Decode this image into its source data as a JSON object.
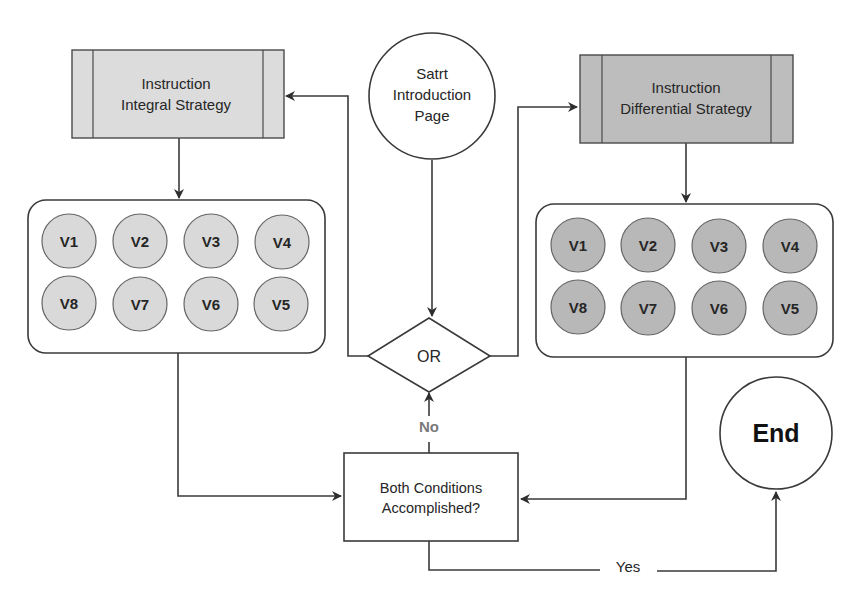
{
  "diagram": {
    "type": "flowchart",
    "colors": {
      "background": "#ffffff",
      "stroke": "#3a3a3a",
      "integral_fill": "#dcdcdc",
      "differential_fill": "#bdbdbd",
      "integral_node_fill": "#d9d9d9",
      "differential_node_fill": "#b8b8b8",
      "no_label_color": "#7a7a7a"
    },
    "start": {
      "lines": [
        "Satrt",
        "Introduction",
        "Page"
      ]
    },
    "integral_strategy": {
      "lines": [
        "Instruction",
        "Integral Strategy"
      ]
    },
    "differential_strategy": {
      "lines": [
        "Instruction",
        "Differential Strategy"
      ]
    },
    "integral_videos": {
      "row1": [
        "V1",
        "V2",
        "V3",
        "V4"
      ],
      "row2": [
        "V8",
        "V7",
        "V6",
        "V5"
      ]
    },
    "differential_videos": {
      "row1": [
        "V1",
        "V2",
        "V3",
        "V4"
      ],
      "row2": [
        "V8",
        "V7",
        "V6",
        "V5"
      ]
    },
    "or_gate": {
      "label": "OR"
    },
    "condition": {
      "lines": [
        "Both Conditions",
        "Accomplished?"
      ]
    },
    "end": {
      "label": "End"
    },
    "edges": {
      "no_label": "No",
      "yes_label": "Yes"
    }
  }
}
